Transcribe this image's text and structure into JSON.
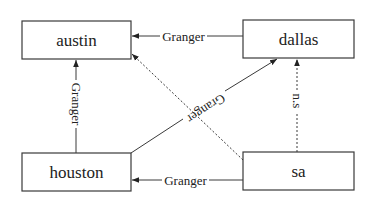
{
  "diagram": {
    "type": "directed-graph",
    "colors": {
      "stroke": "#3a3a3a",
      "text": "#222222",
      "background": "#ffffff"
    },
    "nodes": [
      {
        "id": "austin",
        "label": "austin",
        "x": 22,
        "y": 21,
        "w": 109,
        "h": 38
      },
      {
        "id": "dallas",
        "label": "dallas",
        "x": 243,
        "y": 20,
        "w": 111,
        "h": 38
      },
      {
        "id": "houston",
        "label": "houston",
        "x": 22,
        "y": 153,
        "w": 109,
        "h": 38
      },
      {
        "id": "sa",
        "label": "sa",
        "x": 243,
        "y": 152,
        "w": 111,
        "h": 38
      }
    ],
    "edges": [
      {
        "id": "dallas-austin",
        "from": "dallas",
        "to": "austin",
        "label": "Granger",
        "style": "solid"
      },
      {
        "id": "houston-austin",
        "from": "houston",
        "to": "austin",
        "label": "Granger",
        "style": "solid"
      },
      {
        "id": "houston-dallas",
        "from": "houston",
        "to": "dallas",
        "label": "Granger",
        "style": "solid"
      },
      {
        "id": "sa-austin",
        "from": "sa",
        "to": "austin",
        "label": "",
        "style": "dotted"
      },
      {
        "id": "sa-dallas",
        "from": "sa",
        "to": "dallas",
        "label": "n.s",
        "style": "dotted"
      },
      {
        "id": "sa-houston",
        "from": "sa",
        "to": "houston",
        "label": "Granger",
        "style": "solid"
      }
    ]
  }
}
